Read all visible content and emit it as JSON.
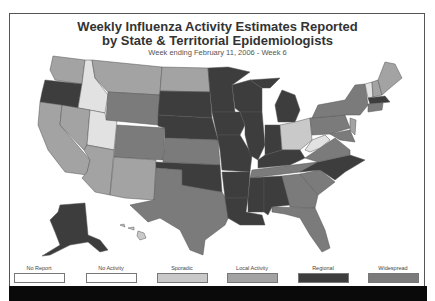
{
  "title_line1": "Weekly Influenza Activity Estimates Reported",
  "title_line2": "by State & Territorial Epidemiologists",
  "subtitle": "Week ending February 11, 2006 - Week 6",
  "legend": [
    {
      "label": "No Report",
      "color": "#ffffff"
    },
    {
      "label": "No Activity",
      "color": "#ffffff"
    },
    {
      "label": "Sporadic",
      "color": "#c9c9c9"
    },
    {
      "label": "Local Activity",
      "color": "#a3a3a3"
    },
    {
      "label": "Regional",
      "color": "#3d3d3d"
    },
    {
      "label": "Widespread",
      "color": "#7b7b7b"
    }
  ],
  "levels": {
    "sporadic": "#c9c9c9",
    "local": "#a3a3a3",
    "regional": "#3d3d3d",
    "widespread": "#7b7b7b",
    "light": "#e2e2e2"
  }
}
